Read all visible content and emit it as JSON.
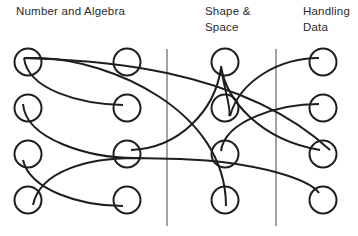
{
  "headers": {
    "number_algebra": "Number and Algebra",
    "shape_space_1": "Shape &",
    "shape_space_2": "Space",
    "handling_data_1": "Handling",
    "handling_data_2": "Data"
  },
  "colors": {
    "stroke": "#1e1e1e",
    "divider": "#555555",
    "text": "#2a2a2a"
  },
  "columns": [
    "Number and Algebra (A)",
    "Number and Algebra (B)",
    "Shape & Space (C)",
    "Handling Data (D)"
  ],
  "nodes_per_column": 4,
  "connections": [
    {
      "from": "A1",
      "to": "B2"
    },
    {
      "from": "A1",
      "to": "D3"
    },
    {
      "from": "A1",
      "to": "C4"
    },
    {
      "from": "A2",
      "to": "B3"
    },
    {
      "from": "A3",
      "to": "B4"
    },
    {
      "from": "A4",
      "to": "B3"
    },
    {
      "from": "B3",
      "to": "D4"
    },
    {
      "from": "B3",
      "to": "C1"
    },
    {
      "from": "C1",
      "to": "C2"
    },
    {
      "from": "C1",
      "to": "D3"
    },
    {
      "from": "C2",
      "to": "D1"
    },
    {
      "from": "C3",
      "to": "D2"
    }
  ]
}
